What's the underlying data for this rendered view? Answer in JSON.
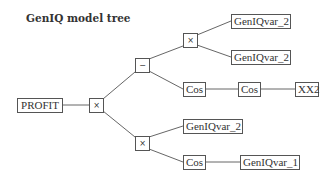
{
  "title": "GenIQ model tree",
  "nodes": {
    "root_var": {
      "label": "PROFIT"
    },
    "root_op": {
      "label": "×"
    },
    "minus_op": {
      "label": "−"
    },
    "upper_mult_op": {
      "label": "×"
    },
    "upper_leaf_1": {
      "label": "GenIQvar_2"
    },
    "upper_leaf_2": {
      "label": "GenIQvar_2"
    },
    "cos_1": {
      "label": "Cos"
    },
    "cos_2": {
      "label": "Cos"
    },
    "xx2": {
      "label": "XX2"
    },
    "lower_mult_op": {
      "label": "×"
    },
    "lower_leaf": {
      "label": "GenIQvar_2"
    },
    "cos_3": {
      "label": "Cos"
    },
    "lower_cos_leaf": {
      "label": "GenIQvar_1"
    }
  },
  "edges": [
    [
      "PROFIT",
      "×(root)"
    ],
    [
      "×(root)",
      "−"
    ],
    [
      "×(root)",
      "×(lower)"
    ],
    [
      "−",
      "×(upper)"
    ],
    [
      "−",
      "Cos"
    ],
    [
      "×(upper)",
      "GenIQvar_2"
    ],
    [
      "×(upper)",
      "GenIQvar_2"
    ],
    [
      "Cos",
      "Cos"
    ],
    [
      "Cos",
      "XX2"
    ],
    [
      "×(lower)",
      "GenIQvar_2"
    ],
    [
      "×(lower)",
      "Cos"
    ],
    [
      "Cos",
      "GenIQvar_1"
    ]
  ]
}
